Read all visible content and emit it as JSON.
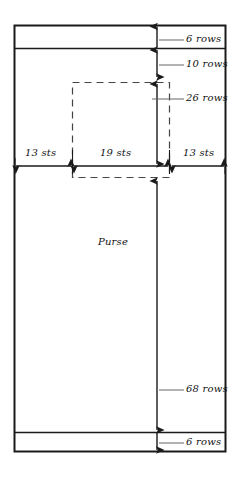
{
  "diagram": {
    "body_label": "Purse",
    "colors": {
      "outline": "#1a1a1a",
      "dashed": "#444444",
      "dimension": "#555555",
      "text": "#111111",
      "background": "#ffffff"
    },
    "vertical_dimensions": [
      {
        "id": "top-band",
        "label": "6 rows",
        "value": 6,
        "unit": "rows"
      },
      {
        "id": "upper-gap",
        "label": "10 rows",
        "value": 10,
        "unit": "rows"
      },
      {
        "id": "flap-depth",
        "label": "26 rows",
        "value": 26,
        "unit": "rows"
      },
      {
        "id": "body-depth",
        "label": "68 rows",
        "value": 68,
        "unit": "rows"
      },
      {
        "id": "bottom-band",
        "label": "6 rows",
        "value": 6,
        "unit": "rows"
      }
    ],
    "horizontal_dimensions": [
      {
        "id": "left-side",
        "label": "13 sts",
        "value": 13,
        "unit": "sts"
      },
      {
        "id": "center",
        "label": "19 sts",
        "value": 19,
        "unit": "sts"
      },
      {
        "id": "right-side",
        "label": "13 sts",
        "value": 13,
        "unit": "sts"
      }
    ]
  }
}
